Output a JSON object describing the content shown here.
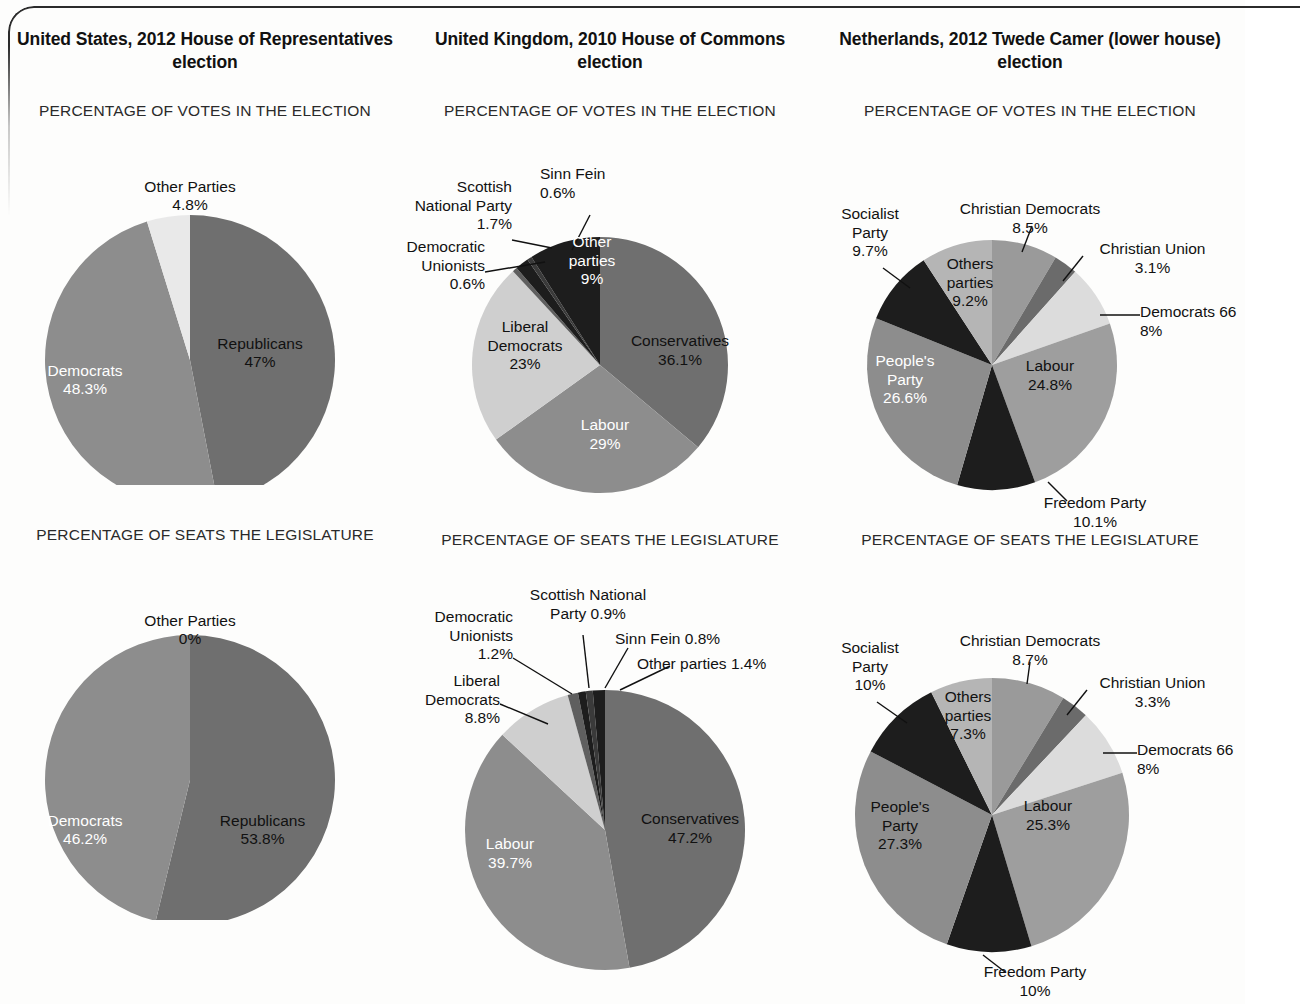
{
  "frame": {
    "accent": "#2b2b2b"
  },
  "palette": {
    "dark": "#6f6f6f",
    "mid": "#8d8d8d",
    "mid_light": "#a3a3a3",
    "light": "#c9c9c9",
    "very_light": "#e9e9e9",
    "near_black": "#1d1d1d",
    "black": "#111111",
    "darker": "#5f5f5f"
  },
  "columns": [
    {
      "key": "us",
      "title": "United States, 2012 House of Representatives election",
      "votes_head": "PERCENTAGE OF VOTES IN THE ELECTION",
      "seats_head": "PERCENTAGE OF SEATS THE LEGISLATURE"
    },
    {
      "key": "uk",
      "title": "United Kingdom, 2010 House of Commons election",
      "votes_head": "PERCENTAGE OF VOTES IN THE ELECTION",
      "seats_head": "PERCENTAGE OF SEATS THE LEGISLATURE"
    },
    {
      "key": "nl",
      "title": "Netherlands, 2012 Twede Camer (lower house) election",
      "votes_head": "PERCENTAGE OF VOTES IN THE ELECTION",
      "seats_head": "PERCENTAGE OF SEATS THE LEGISLATURE"
    }
  ],
  "labels": {
    "us_votes_other_name": "Other Parties",
    "us_votes_other_val": "4.8%",
    "us_votes_rep_name": "Republicans",
    "us_votes_rep_val": "47%",
    "us_votes_dem_name": "Democrats",
    "us_votes_dem_val": "48.3%",
    "us_seats_other_name": "Other Parties",
    "us_seats_other_val": "0%",
    "us_seats_rep_name": "Republicans",
    "us_seats_rep_val": "53.8%",
    "us_seats_dem_name": "Democrats",
    "us_seats_dem_val": "46.2%",
    "uk_votes_snp": "Scottish\nNational Party\n1.7%",
    "uk_votes_sf": "Sinn Fein\n0.6%",
    "uk_votes_du": "Democratic\nUnionists\n0.6%",
    "uk_votes_other": "Other\nparties\n9%",
    "uk_votes_libdem": "Liberal\nDemocrats\n23%",
    "uk_votes_con": "Conservatives\n36.1%",
    "uk_votes_lab": "Labour\n29%",
    "uk_seats_snp": "Scottish National\nParty 0.9%",
    "uk_seats_sf": "Sinn Fein 0.8%",
    "uk_seats_other": "Other parties 1.4%",
    "uk_seats_du": "Democratic\nUnionists\n1.2%",
    "uk_seats_libdem": "Liberal\nDemocrats\n8.8%",
    "uk_seats_con": "Conservatives\n47.2%",
    "uk_seats_lab": "Labour\n39.7%",
    "nl_votes_cd": "Christian Democrats\n8.5%",
    "nl_votes_cu": "Christian Union\n3.1%",
    "nl_votes_d66": "Democrats 66\n8%",
    "nl_votes_soc": "Socialist\nParty\n9.7%",
    "nl_votes_others": "Others\nparties\n9.2%",
    "nl_votes_pp": "People's\nParty\n26.6%",
    "nl_votes_lab": "Labour\n24.8%",
    "nl_votes_free": "Freedom Party\n10.1%",
    "nl_seats_cd": "Christian Democrats\n8.7%",
    "nl_seats_cu": "Christian Union\n3.3%",
    "nl_seats_d66": "Democrats 66\n8%",
    "nl_seats_soc": "Socialist\nParty\n10%",
    "nl_seats_others": "Others\nparties\n7.3%",
    "nl_seats_pp": "People's\nParty\n27.3%",
    "nl_seats_lab": "Labour\n25.3%",
    "nl_seats_free": "Freedom Party\n10%"
  },
  "chart_data": [
    {
      "type": "pie",
      "id": "us-votes",
      "title": "United States, 2012 House of Representatives election",
      "subtitle": "PERCENTAGE OF VOTES IN THE ELECTION",
      "start_angle_deg": 0,
      "direction": "clockwise",
      "categories": [
        "Republicans",
        "Democrats",
        "Other Parties"
      ],
      "values": [
        47,
        48.3,
        4.8
      ],
      "labels": [
        "47%",
        "48.3%",
        "4.8%"
      ],
      "colors": [
        "#6f6f6f",
        "#8d8d8d",
        "#e9e9e9"
      ]
    },
    {
      "type": "pie",
      "id": "uk-votes",
      "title": "United Kingdom, 2010 House of Commons election",
      "subtitle": "PERCENTAGE OF VOTES IN THE ELECTION",
      "start_angle_deg": 0,
      "direction": "clockwise",
      "categories": [
        "Conservatives",
        "Labour",
        "Liberal Democrats",
        "Democratic Unionists",
        "Scottish National Party",
        "Sinn Fein",
        "Other parties"
      ],
      "values": [
        36.1,
        29,
        23,
        0.6,
        1.7,
        0.6,
        9
      ],
      "labels": [
        "36.1%",
        "29%",
        "23%",
        "0.6%",
        "1.7%",
        "0.6%",
        "9%"
      ],
      "colors": [
        "#6f6f6f",
        "#8d8d8d",
        "#cfcfcf",
        "#5f5f5f",
        "#1d1d1d",
        "#3a3a3a",
        "#1d1d1d"
      ]
    },
    {
      "type": "pie",
      "id": "nl-votes",
      "title": "Netherlands, 2012 Twede Camer (lower house) election",
      "subtitle": "PERCENTAGE OF VOTES IN THE ELECTION",
      "start_angle_deg": 0,
      "direction": "clockwise",
      "categories": [
        "Christian Democrats",
        "Christian Union",
        "Democrats 66",
        "Labour",
        "Freedom Party",
        "People's Party",
        "Socialist Party",
        "Others parties"
      ],
      "values": [
        8.5,
        3.1,
        8,
        24.8,
        10.1,
        26.6,
        9.7,
        9.2
      ],
      "labels": [
        "8.5%",
        "3.1%",
        "8%",
        "24.8%",
        "10.1%",
        "26.6%",
        "9.7%",
        "9.2%"
      ],
      "colors": [
        "#9a9a9a",
        "#6b6b6b",
        "#dcdcdc",
        "#9e9e9e",
        "#1d1d1d",
        "#8d8d8d",
        "#1d1d1d",
        "#b5b5b5"
      ]
    },
    {
      "type": "pie",
      "id": "us-seats",
      "title": "United States, 2012 House of Representatives election",
      "subtitle": "PERCENTAGE OF SEATS THE LEGISLATURE",
      "start_angle_deg": 0,
      "direction": "clockwise",
      "categories": [
        "Republicans",
        "Democrats",
        "Other Parties"
      ],
      "values": [
        53.8,
        46.2,
        0
      ],
      "labels": [
        "53.8%",
        "46.2%",
        "0%"
      ],
      "colors": [
        "#6f6f6f",
        "#8d8d8d",
        "#e9e9e9"
      ]
    },
    {
      "type": "pie",
      "id": "uk-seats",
      "title": "United Kingdom, 2010 House of Commons election",
      "subtitle": "PERCENTAGE OF SEATS THE LEGISLATURE",
      "start_angle_deg": 0,
      "direction": "clockwise",
      "categories": [
        "Conservatives",
        "Labour",
        "Liberal Democrats",
        "Democratic Unionists",
        "Scottish National Party",
        "Sinn Fein",
        "Other parties"
      ],
      "values": [
        47.2,
        39.7,
        8.8,
        1.2,
        0.9,
        0.8,
        1.4
      ],
      "labels": [
        "47.2%",
        "39.7%",
        "8.8%",
        "1.2%",
        "0.9%",
        "0.8%",
        "1.4%"
      ],
      "colors": [
        "#6f6f6f",
        "#8d8d8d",
        "#cfcfcf",
        "#5f5f5f",
        "#1d1d1d",
        "#3a3a3a",
        "#1d1d1d"
      ]
    },
    {
      "type": "pie",
      "id": "nl-seats",
      "title": "Netherlands, 2012 Twede Camer (lower house) election",
      "subtitle": "PERCENTAGE OF SEATS THE LEGISLATURE",
      "start_angle_deg": 0,
      "direction": "clockwise",
      "categories": [
        "Christian Democrats",
        "Christian Union",
        "Democrats 66",
        "Labour",
        "Freedom Party",
        "People's Party",
        "Socialist Party",
        "Others parties"
      ],
      "values": [
        8.7,
        3.3,
        8,
        25.3,
        10,
        27.3,
        10,
        7.3
      ],
      "labels": [
        "8.7%",
        "3.3%",
        "8%",
        "25.3%",
        "10%",
        "27.3%",
        "10%",
        "7.3%"
      ],
      "colors": [
        "#9a9a9a",
        "#6b6b6b",
        "#dcdcdc",
        "#9e9e9e",
        "#1d1d1d",
        "#8d8d8d",
        "#1d1d1d",
        "#b5b5b5"
      ]
    }
  ]
}
